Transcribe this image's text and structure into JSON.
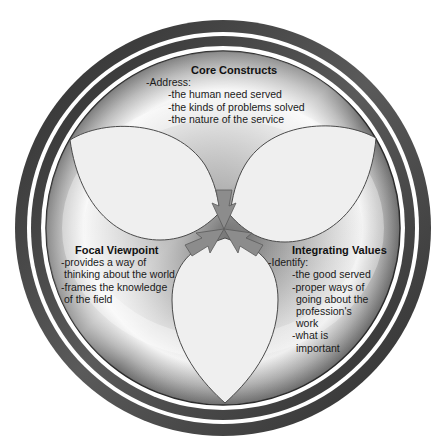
{
  "diagram": {
    "center": {
      "x": 224,
      "y": 229
    },
    "colors": {
      "ring_dark": "#3c3c3c",
      "ring_mid": "#6a6a6a",
      "disc_dark": "#7a7a7a",
      "disc_light": "#f2f2f2",
      "petal_fill": "#efefef",
      "petal_stroke": "#555555",
      "arrow_fill": "#8a8a8a"
    },
    "petals": [
      "core-constructs-petal",
      "integrating-values-petal",
      "focal-viewpoint-petal"
    ]
  },
  "sections": {
    "core": {
      "title": "Core Constructs",
      "lead": "-Address:",
      "items": [
        "-the human need served",
        "-the kinds of problems solved",
        "-the nature of the service"
      ]
    },
    "focal": {
      "title": "Focal Viewpoint",
      "items": [
        "-provides a way of",
        "thinking about the world",
        "-frames the knowledge",
        "of the field"
      ]
    },
    "integrating": {
      "title": "Integrating Values",
      "lead": "-Identify:",
      "items": [
        "-the good served",
        "-proper ways of",
        "going about the",
        "profession's",
        "work",
        "-what is",
        "important"
      ]
    }
  }
}
